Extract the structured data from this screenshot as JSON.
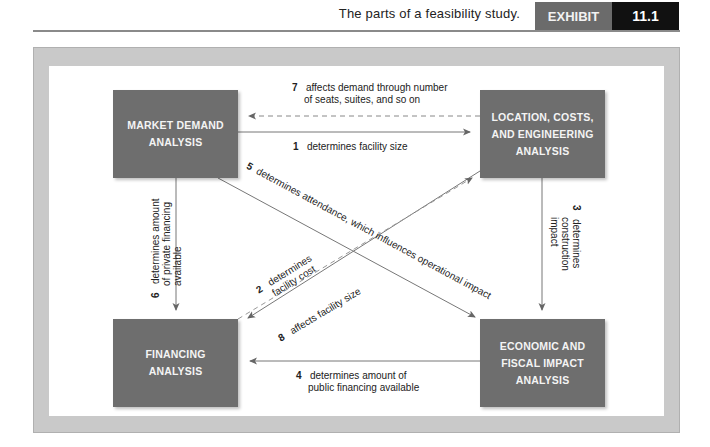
{
  "header": {
    "title": "The parts of a feasibility study.",
    "exhibit_label": "EXHIBIT",
    "exhibit_number": "11.1"
  },
  "colors": {
    "box_fill": "#6e6e6e",
    "frame": "#c9c9c9",
    "exhibit_label_bg": "#6b6b6b",
    "exhibit_number_bg": "#111111",
    "arrow": "#666666"
  },
  "nodes": {
    "market_demand": "MARKET DEMAND ANALYSIS",
    "location": "LOCATION, COSTS, AND ENGINEERING ANALYSIS",
    "financing": "FINANCING ANALYSIS",
    "economic": "ECONOMIC AND FISCAL IMPACT ANALYSIS"
  },
  "edges": [
    {
      "num": "1",
      "text": "determines facility size",
      "from": "market_demand",
      "to": "location",
      "style": "solid"
    },
    {
      "num": "2",
      "text": "determines facility cost",
      "from": "location",
      "to": "financing",
      "style": "solid"
    },
    {
      "num": "3",
      "text": "determines construction impact",
      "from": "location",
      "to": "economic",
      "style": "solid"
    },
    {
      "num": "4",
      "text": "determines amount of public financing available",
      "from": "economic",
      "to": "financing",
      "style": "solid"
    },
    {
      "num": "5",
      "text": "determines attendance, which influences operational impact",
      "from": "market_demand",
      "to": "economic",
      "style": "solid"
    },
    {
      "num": "6",
      "text": "determines amount of private financing available",
      "from": "market_demand",
      "to": "financing",
      "style": "solid"
    },
    {
      "num": "7",
      "text": "affects demand through number of seats, suites, and so on",
      "from": "location",
      "to": "market_demand",
      "style": "dashed"
    },
    {
      "num": "8",
      "text": "affects facility size",
      "from": "financing",
      "to": "location",
      "style": "dashed"
    }
  ],
  "labels": {
    "e1": {
      "num": "1",
      "line1": "determines facility size"
    },
    "e2": {
      "num": "2",
      "line1": "determines",
      "line2": "facility cost"
    },
    "e3": {
      "num": "3",
      "line1": "determines",
      "line2": "construction",
      "line3": "impact"
    },
    "e4": {
      "num": "4",
      "line1": "determines amount of",
      "line2": "public financing available"
    },
    "e5": {
      "num": "5",
      "line1": "determines attendance, which influences operational impact"
    },
    "e6": {
      "num": "6",
      "line1": "determines amount",
      "line2": "of private financing",
      "line3": "available"
    },
    "e7": {
      "num": "7",
      "line1": "affects demand through number",
      "line2": "of seats, suites, and so on"
    },
    "e8": {
      "num": "8",
      "line1": "affects facility size"
    }
  }
}
